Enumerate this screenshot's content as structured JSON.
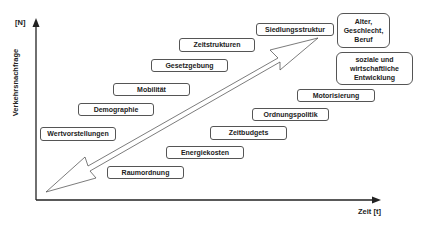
{
  "axes": {
    "y_unit": "[N]",
    "y_label": "Verkehrsnachfrage",
    "x_label": "Zeit [t]"
  },
  "boxes": [
    {
      "id": "siedlungsstruktur",
      "label": "Siedlungsstruktur"
    },
    {
      "id": "alter",
      "label": "Alter,\nGeschlecht,\nBeruf"
    },
    {
      "id": "zeitstrukturen",
      "label": "Zeitstrukturen"
    },
    {
      "id": "gesetzgebung",
      "label": "Gesetzgebung"
    },
    {
      "id": "soziale",
      "label": "soziale und\nwirtschaftliche\nEntwicklung"
    },
    {
      "id": "mobilitaet",
      "label": "Mobilität"
    },
    {
      "id": "motorisierung",
      "label": "Motorisierung"
    },
    {
      "id": "demographie",
      "label": "Demographie"
    },
    {
      "id": "ordnungspolitik",
      "label": "Ordnungspolitik"
    },
    {
      "id": "wertvorstellungen",
      "label": "Wertvorstellungen"
    },
    {
      "id": "zeitbudgets",
      "label": "Zeitbudgets"
    },
    {
      "id": "energiekosten",
      "label": "Energiekosten"
    },
    {
      "id": "raumordnung",
      "label": "Raumordnung"
    }
  ],
  "colors": {
    "line": "#222222",
    "box_border": "#555555",
    "background": "#ffffff"
  }
}
